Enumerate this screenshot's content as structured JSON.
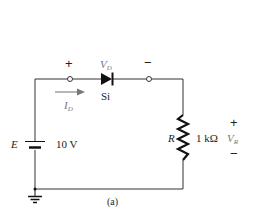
{
  "figure": {
    "caption": "(a)",
    "type": "series diode circuit"
  },
  "source": {
    "symbol": "E",
    "value": "10 V"
  },
  "diode": {
    "material": "Si",
    "voltage_label": "V",
    "voltage_sub": "D",
    "plus": "+",
    "minus": "−"
  },
  "current": {
    "label": "I",
    "sub": "D"
  },
  "resistor": {
    "symbol": "R",
    "value": "1 kΩ",
    "voltage_label": "V",
    "voltage_sub": "R",
    "plus": "+",
    "minus": "−"
  },
  "colors": {
    "wire": "#333333",
    "arrow": "#888888",
    "label_gray": "#777777"
  }
}
